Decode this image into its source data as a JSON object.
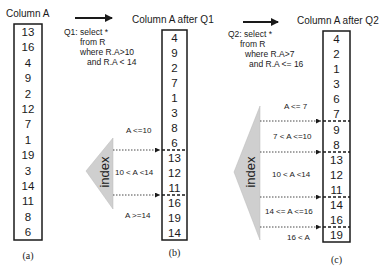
{
  "panels": {
    "a": {
      "title": "Column A",
      "caption": "(a)",
      "values": [
        "13",
        "16",
        "4",
        "9",
        "2",
        "12",
        "7",
        "1",
        "19",
        "3",
        "14",
        "11",
        "8",
        "6"
      ]
    },
    "b": {
      "title": "Column A after Q1",
      "caption": "(b)",
      "values": [
        "4",
        "9",
        "2",
        "7",
        "1",
        "3",
        "8",
        "6",
        "13",
        "12",
        "11",
        "16",
        "19",
        "14"
      ],
      "query": [
        "Q1: select *",
        "from R",
        "where R.A>10",
        "and R.A < 14"
      ],
      "index_label": "index",
      "ranges": [
        "A <=10",
        "10 < A <14",
        "A >=14"
      ]
    },
    "c": {
      "title": "Column A after Q2",
      "caption": "(c)",
      "values": [
        "4",
        "2",
        "1",
        "3",
        "6",
        "7",
        "9",
        "8",
        "13",
        "12",
        "11",
        "14",
        "16",
        "19"
      ],
      "query": [
        "Q2: select *",
        "from R",
        "where R.A>7",
        "and R.A <= 16"
      ],
      "index_label": "index",
      "ranges": [
        "A <= 7",
        "7 < A <=10",
        "10 < A <14",
        "14 <= A <=16",
        "16 < A"
      ]
    }
  },
  "colors": {
    "ink": "#1a1a1a",
    "index_fill": "#cfcfcf"
  }
}
